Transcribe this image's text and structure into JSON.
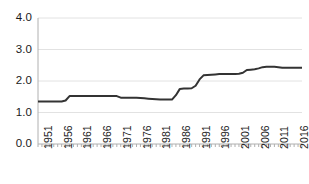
{
  "chart_data": {
    "type": "line",
    "title": "",
    "xlabel": "",
    "ylabel": "",
    "grid": true,
    "legend": false,
    "xlim": [
      1951,
      2018
    ],
    "ylim": [
      0.0,
      4.0
    ],
    "ytick_labels": [
      "4.0",
      "3.0",
      "2.0",
      "1.0",
      "0.0"
    ],
    "ytick_values": [
      4.0,
      3.0,
      2.0,
      1.0,
      0.0
    ],
    "xtick_labels": [
      "1951",
      "1956",
      "1961",
      "1966",
      "1971",
      "1976",
      "1981",
      "1986",
      "1991",
      "1996",
      "2001",
      "2006",
      "2011",
      "2016"
    ],
    "xtick_values": [
      1951,
      1956,
      1961,
      1966,
      1971,
      1976,
      1981,
      1986,
      1991,
      1996,
      2001,
      2006,
      2011,
      2016
    ],
    "series": [
      {
        "name": "value",
        "color": "#333333",
        "x": [
          1951,
          1952,
          1953,
          1954,
          1955,
          1956,
          1957,
          1958,
          1959,
          1960,
          1961,
          1962,
          1963,
          1964,
          1965,
          1966,
          1967,
          1968,
          1969,
          1970,
          1971,
          1972,
          1973,
          1974,
          1975,
          1976,
          1977,
          1978,
          1979,
          1980,
          1981,
          1982,
          1983,
          1984,
          1985,
          1986,
          1987,
          1988,
          1989,
          1990,
          1991,
          1992,
          1993,
          1994,
          1995,
          1996,
          1997,
          1998,
          1999,
          2000,
          2001,
          2002,
          2003,
          2004,
          2005,
          2006,
          2007,
          2008,
          2009,
          2010,
          2011,
          2012,
          2013,
          2014,
          2015,
          2016,
          2017,
          2018
        ],
        "values": [
          1.35,
          1.35,
          1.35,
          1.35,
          1.35,
          1.35,
          1.35,
          1.38,
          1.52,
          1.52,
          1.52,
          1.52,
          1.52,
          1.52,
          1.52,
          1.52,
          1.52,
          1.52,
          1.52,
          1.52,
          1.52,
          1.47,
          1.47,
          1.47,
          1.47,
          1.47,
          1.46,
          1.45,
          1.44,
          1.43,
          1.42,
          1.41,
          1.41,
          1.41,
          1.41,
          1.55,
          1.75,
          1.76,
          1.76,
          1.77,
          1.85,
          2.05,
          2.18,
          2.19,
          2.2,
          2.21,
          2.22,
          2.22,
          2.22,
          2.22,
          2.22,
          2.23,
          2.26,
          2.35,
          2.36,
          2.37,
          2.4,
          2.44,
          2.45,
          2.45,
          2.45,
          2.44,
          2.42,
          2.42,
          2.42,
          2.42,
          2.42,
          2.42
        ]
      }
    ]
  }
}
